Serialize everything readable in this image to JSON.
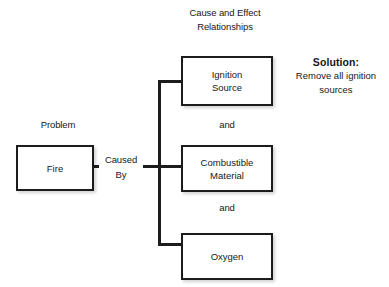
{
  "diagram": {
    "type": "cause-and-effect-tree",
    "background_color": "#ffffff",
    "line_color": "#1c1c1c",
    "text_color": "#171717",
    "header": {
      "line1": "Cause and Effect",
      "line2": "Relationships"
    },
    "solution": {
      "title": "Solution:",
      "line1": "Remove all ignition",
      "line2": "sources"
    },
    "labels": {
      "problem": "Problem",
      "caused_by_line1": "Caused",
      "caused_by_line2": "By",
      "and_1": "and",
      "and_2": "and"
    },
    "nodes": {
      "problem_box": {
        "line1": "Fire"
      },
      "cause_boxes": [
        {
          "line1": "Ignition",
          "line2": "Source"
        },
        {
          "line1": "Combustible",
          "line2": "Material"
        },
        {
          "line1": "Oxygen",
          "line2": ""
        }
      ]
    }
  }
}
